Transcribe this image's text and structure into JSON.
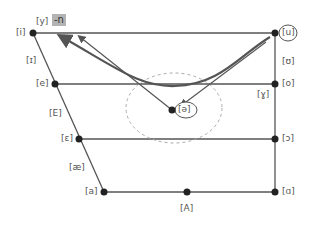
{
  "diagram": {
    "tag": "-n",
    "colors": {
      "line": "#555555",
      "point": "#222222",
      "arrow_thick": "#555555",
      "dashed_circle": "#aaaaaa",
      "tag_bg": "#b3b3b3"
    },
    "vowels": {
      "i": "[i]",
      "y": "[y]",
      "u": "[u]",
      "I": "[ɪ]",
      "U": "[ʊ]",
      "e": "[e]",
      "o": "[o]",
      "gamma": "[ɣ]",
      "E": "[E]",
      "schwa": "[ə]",
      "epsilon": "[ɛ]",
      "open_o": "[ɔ]",
      "ae": "[æ]",
      "a": "[a]",
      "A": "[A]",
      "alpha": "[ɑ]"
    },
    "annotations": {
      "circled": [
        "[u]",
        "[ə]"
      ],
      "arrows": [
        {
          "from": "[u]",
          "to": "[i] region",
          "style": "curved thick"
        },
        {
          "from": "[u]",
          "to": "[ə]",
          "style": "straight"
        },
        {
          "from": "[ə]",
          "to": "[i] region",
          "style": "straight"
        }
      ]
    }
  }
}
